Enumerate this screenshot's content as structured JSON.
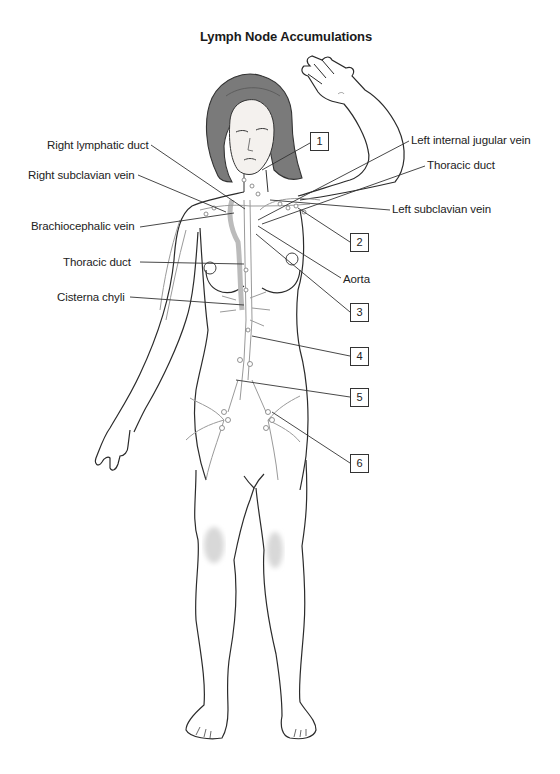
{
  "title": "Lymph Node Accumulations",
  "labels_left": [
    {
      "id": "right-lymphatic-duct",
      "text": "Right lymphatic duct",
      "x": 47,
      "y": 140
    },
    {
      "id": "right-subclavian-vein",
      "text": "Right subclavian vein",
      "x": 28,
      "y": 170
    },
    {
      "id": "brachiocephalic-vein",
      "text": "Brachiocephalic vein",
      "x": 31,
      "y": 220
    },
    {
      "id": "thoracic-duct-left",
      "text": "Thoracic duct",
      "x": 63,
      "y": 257
    },
    {
      "id": "cisterna-chyli",
      "text": "Cisterna chyli",
      "x": 57,
      "y": 292
    }
  ],
  "labels_right": [
    {
      "id": "left-internal-jugular-vein",
      "text": "Left internal jugular vein",
      "x": 411,
      "y": 134
    },
    {
      "id": "thoracic-duct-right",
      "text": "Thoracic duct",
      "x": 427,
      "y": 159
    },
    {
      "id": "left-subclavian-vein",
      "text": "Left subclavian vein",
      "x": 392,
      "y": 203
    },
    {
      "id": "aorta",
      "text": "Aorta",
      "x": 343,
      "y": 272
    }
  ],
  "numbered_boxes": [
    {
      "n": "1",
      "x": 310,
      "y": 132
    },
    {
      "n": "2",
      "x": 350,
      "y": 233
    },
    {
      "n": "3",
      "x": 350,
      "y": 303
    },
    {
      "n": "4",
      "x": 350,
      "y": 347
    },
    {
      "n": "5",
      "x": 350,
      "y": 388
    },
    {
      "n": "6",
      "x": 350,
      "y": 454
    }
  ],
  "colors": {
    "outline": "#2b2b2b",
    "hair": "#6e6e6e",
    "lymph": "#9a9a9a",
    "vein_fill": "#c9c9c9",
    "leader": "#333333"
  }
}
